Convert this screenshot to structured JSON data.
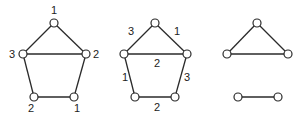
{
  "colors": {
    "stroke": "#2a2a2a",
    "node_fill": "#ffffff",
    "text": "#222222"
  },
  "graphs": [
    {
      "name": "vertex-colored-graph",
      "nodes": [
        {
          "id": "a",
          "x": 54,
          "y": 23,
          "label": "1",
          "lx": 54,
          "ly": 14
        },
        {
          "id": "b",
          "x": 23,
          "y": 54,
          "label": "3",
          "lx": 12,
          "ly": 58
        },
        {
          "id": "c",
          "x": 86,
          "y": 54,
          "label": "2",
          "lx": 96,
          "ly": 58
        },
        {
          "id": "d",
          "x": 34,
          "y": 97,
          "label": "2",
          "lx": 31,
          "ly": 112
        },
        {
          "id": "e",
          "x": 74,
          "y": 97,
          "label": "1",
          "lx": 77,
          "ly": 112
        }
      ],
      "edges": [
        [
          "a",
          "b"
        ],
        [
          "a",
          "c"
        ],
        [
          "b",
          "c"
        ],
        [
          "b",
          "d"
        ],
        [
          "c",
          "e"
        ],
        [
          "d",
          "e"
        ]
      ],
      "edge_labels": []
    },
    {
      "name": "edge-colored-graph",
      "nodes": [
        {
          "id": "a",
          "x": 155,
          "y": 23
        },
        {
          "id": "b",
          "x": 124,
          "y": 54
        },
        {
          "id": "c",
          "x": 187,
          "y": 54
        },
        {
          "id": "d",
          "x": 135,
          "y": 97
        },
        {
          "id": "e",
          "x": 175,
          "y": 97
        }
      ],
      "edges": [
        [
          "a",
          "b"
        ],
        [
          "a",
          "c"
        ],
        [
          "b",
          "c"
        ],
        [
          "b",
          "d"
        ],
        [
          "c",
          "e"
        ],
        [
          "d",
          "e"
        ]
      ],
      "edge_labels": [
        {
          "text": "3",
          "x": 131,
          "y": 35
        },
        {
          "text": "1",
          "x": 177,
          "y": 35
        },
        {
          "text": "2",
          "x": 157,
          "y": 67
        },
        {
          "text": "1",
          "x": 125,
          "y": 81
        },
        {
          "text": "3",
          "x": 187,
          "y": 81
        },
        {
          "text": "2",
          "x": 157,
          "y": 111
        }
      ]
    },
    {
      "name": "subgraph-components",
      "nodes": [
        {
          "id": "a",
          "x": 257,
          "y": 23
        },
        {
          "id": "b",
          "x": 227,
          "y": 54
        },
        {
          "id": "c",
          "x": 288,
          "y": 54
        },
        {
          "id": "d",
          "x": 238,
          "y": 97
        },
        {
          "id": "e",
          "x": 278,
          "y": 97
        }
      ],
      "edges": [
        [
          "a",
          "b"
        ],
        [
          "a",
          "c"
        ],
        [
          "b",
          "c"
        ],
        [
          "d",
          "e"
        ]
      ],
      "edge_labels": []
    }
  ]
}
